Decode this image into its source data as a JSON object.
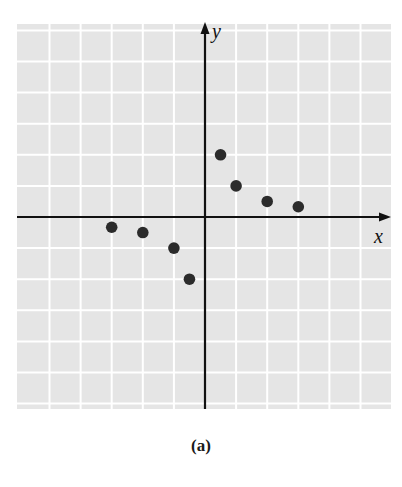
{
  "figure": {
    "caption": "(a)",
    "background_color": "#ffffff",
    "grid_fill_color": "#e5e5e5",
    "grid_line_color": "#ffffff",
    "axis_color": "#111111",
    "point_color": "#2b2b2b"
  },
  "chart_data": {
    "type": "scatter",
    "title": "",
    "caption": "(a)",
    "xlabel": "x",
    "ylabel": "y",
    "xlim": [
      -6,
      6
    ],
    "ylim": [
      -6.2,
      6.2
    ],
    "grid": true,
    "tick_labels": false,
    "legend": null,
    "series": [
      {
        "name": "points",
        "points": [
          {
            "x": -3,
            "y": -0.33
          },
          {
            "x": -2,
            "y": -0.5
          },
          {
            "x": -1,
            "y": -1
          },
          {
            "x": -0.5,
            "y": -2
          },
          {
            "x": 0.5,
            "y": 2
          },
          {
            "x": 1,
            "y": 1
          },
          {
            "x": 2,
            "y": 0.5
          },
          {
            "x": 3,
            "y": 0.33
          }
        ]
      }
    ]
  }
}
